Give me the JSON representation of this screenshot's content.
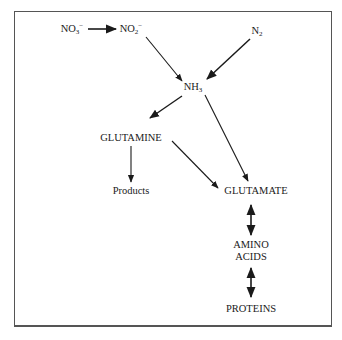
{
  "diagram": {
    "nodes": {
      "nitrate": {
        "base": "NO",
        "sub": "3",
        "sup": "−"
      },
      "nitrite": {
        "base": "NO",
        "sub": "2",
        "sup": "−"
      },
      "nitrogen": {
        "base": "N",
        "sub": "2"
      },
      "ammonia": {
        "base": "NH",
        "sub": "3"
      },
      "glutamine": "GLUTAMINE",
      "products": "Products",
      "glutamate": "GLUTAMATE",
      "amino_acids_line1": "AMINO",
      "amino_acids_line2": "ACIDS",
      "proteins": "PROTEINS"
    },
    "edges": [
      {
        "from": "NO3-",
        "to": "NO2-",
        "type": "single"
      },
      {
        "from": "NO2-",
        "to": "NH3",
        "type": "single"
      },
      {
        "from": "N2",
        "to": "NH3",
        "type": "single"
      },
      {
        "from": "NH3",
        "to": "GLUTAMINE",
        "type": "single"
      },
      {
        "from": "NH3",
        "to": "GLUTAMATE",
        "type": "single"
      },
      {
        "from": "GLUTAMINE",
        "to": "Products",
        "type": "single"
      },
      {
        "from": "GLUTAMINE",
        "to": "GLUTAMATE",
        "type": "single"
      },
      {
        "from": "GLUTAMATE",
        "to": "AMINO ACIDS",
        "type": "double"
      },
      {
        "from": "AMINO ACIDS",
        "to": "PROTEINS",
        "type": "double"
      }
    ],
    "colors": {
      "line": "#1a1a1a",
      "frame": "#555555",
      "background": "#ffffff"
    }
  }
}
